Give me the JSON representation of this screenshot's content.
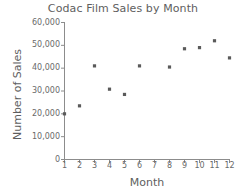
{
  "chart_data": {
    "type": "scatter",
    "title": "Codac Film Sales by Month",
    "xlabel": "Month",
    "ylabel": "Number of Sales",
    "x": [
      1,
      2,
      3,
      4,
      5,
      6,
      8,
      9,
      10,
      11,
      12
    ],
    "values": [
      20000,
      23500,
      41000,
      30800,
      28500,
      41000,
      40500,
      48500,
      49000,
      52000,
      44500
    ],
    "points": [
      {
        "month": 1,
        "sales": 20000
      },
      {
        "month": 2,
        "sales": 23500
      },
      {
        "month": 3,
        "sales": 41000
      },
      {
        "month": 4,
        "sales": 30800
      },
      {
        "month": 5,
        "sales": 28500
      },
      {
        "month": 6,
        "sales": 41000
      },
      {
        "month": 8,
        "sales": 40500
      },
      {
        "month": 9,
        "sales": 48500
      },
      {
        "month": 10,
        "sales": 49000
      },
      {
        "month": 11,
        "sales": 52000
      },
      {
        "month": 12,
        "sales": 44500
      }
    ],
    "xlim": [
      1,
      12
    ],
    "ylim": [
      0,
      60000
    ],
    "xticks": [
      1,
      2,
      3,
      4,
      5,
      6,
      7,
      8,
      9,
      10,
      11,
      12
    ],
    "xtick_labels": [
      "1",
      "2",
      "3",
      "4",
      "5",
      "6",
      "7",
      "8",
      "9",
      "10",
      "11",
      "12"
    ],
    "yticks": [
      0,
      10000,
      20000,
      30000,
      40000,
      50000,
      60000
    ],
    "ytick_labels": [
      "0",
      "10,000",
      "20,000",
      "30,000",
      "40,000",
      "50,000",
      "60,000"
    ],
    "grid": false,
    "legend": null,
    "marker_color": "#5a5a5a",
    "axis_color": "#8c8c8c",
    "text_color": "#5e5e5e",
    "background": "#ffffff"
  }
}
